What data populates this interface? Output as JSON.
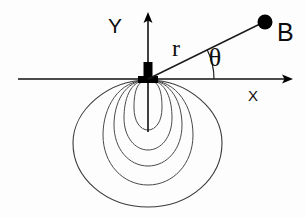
{
  "figure": {
    "background_color": "#fdfdfd",
    "line_color": "#1a1a1a",
    "lobe_color": "#4a4a4a",
    "labels": {
      "y_axis": "Y",
      "x_axis": "X",
      "radius": "r",
      "angle": "θ",
      "point": "B"
    },
    "axes": {
      "origin": {
        "x": 148,
        "y": 79
      },
      "x_axis_start": {
        "x": 18,
        "y": 79
      },
      "x_axis_end": {
        "x": 292,
        "y": 79
      },
      "y_axis_start": {
        "x": 148,
        "y": 132
      },
      "y_axis_end": {
        "x": 148,
        "y": 14
      },
      "x_label_pos": {
        "x": 253,
        "y": 98
      },
      "y_label_pos": {
        "x": 122,
        "y": 31
      }
    },
    "point_b": {
      "label": "B",
      "position": {
        "x": 265,
        "y": 22
      },
      "radius_px": 7,
      "label_pos": {
        "x": 278,
        "y": 36
      }
    },
    "ray": {
      "from": {
        "x": 148,
        "y": 79
      },
      "to": {
        "x": 265,
        "y": 22
      },
      "label": "r",
      "label_pos": {
        "x": 176,
        "y": 55
      }
    },
    "angle_arc": {
      "label": "θ",
      "label_pos": {
        "x": 213,
        "y": 64
      },
      "vertex": {
        "x": 148,
        "y": 79
      },
      "radius_px": 66,
      "start_deg": 0,
      "end_deg": 26
    },
    "dipole_marker": {
      "shape": "rectangle",
      "x": 143,
      "y": 62,
      "width": 10,
      "height": 20,
      "color": "#000000"
    },
    "field_lobes": {
      "count": 5,
      "description": "nested downward teardrop field lines from dipole at origin",
      "widths": [
        28,
        48,
        68,
        90,
        149
      ],
      "heights": [
        50,
        78,
        100,
        123,
        128
      ],
      "color": "#4a4a4a"
    }
  }
}
